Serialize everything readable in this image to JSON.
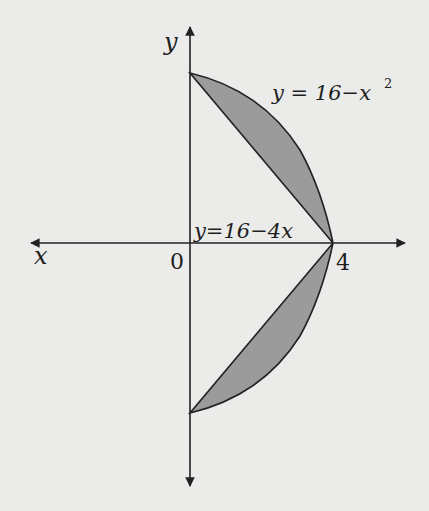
{
  "diagram": {
    "axes": {
      "x_label": "x",
      "y_label": "y",
      "origin_label": "0",
      "tick_label": "4"
    },
    "curves": {
      "parabola_label": "y = 16−x",
      "parabola_exponent": "2",
      "line_label": "y=16−4x"
    },
    "colors": {
      "background": "#ebebea",
      "fill": "#9b9b9b",
      "stroke": "#222222"
    }
  }
}
